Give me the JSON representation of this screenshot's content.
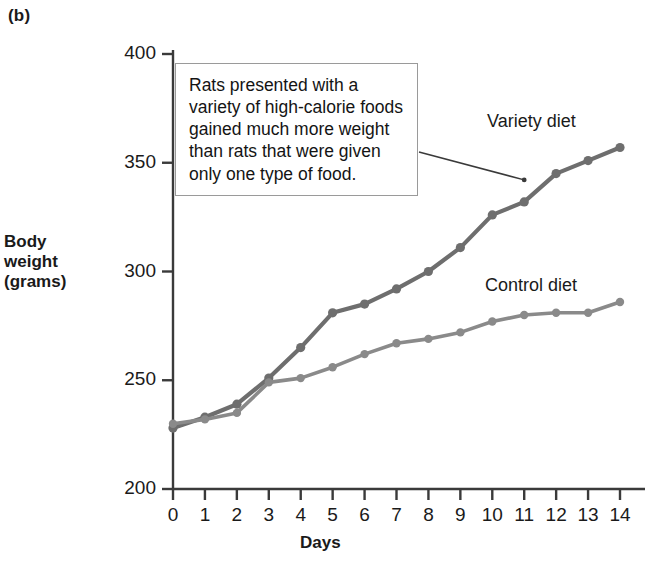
{
  "figure": {
    "panel_label": "(b)",
    "callout_text": "Rats presented with a variety of high-calorie foods gained much more weight than rats that were given only one type of food.",
    "series_label_variety": "Variety diet",
    "series_label_control": "Control diet",
    "y_axis_label_line1": "Body",
    "y_axis_label_line2": "weight",
    "y_axis_label_line3": "(grams)",
    "x_axis_label": "Days"
  },
  "colors": {
    "variety_line": "#6e6e6e",
    "control_line": "#8a8a8a",
    "axis": "#3a3a3a",
    "callout_border": "#9a9a9a",
    "text": "#1a1a1a"
  },
  "chart_data": {
    "type": "line",
    "title": "",
    "xlabel": "Days",
    "ylabel": "Body weight (grams)",
    "xlim": [
      0,
      14
    ],
    "ylim": [
      200,
      400
    ],
    "xticks": [
      0,
      1,
      2,
      3,
      4,
      5,
      6,
      7,
      8,
      9,
      10,
      11,
      12,
      13,
      14
    ],
    "yticks": [
      200,
      250,
      300,
      350,
      400
    ],
    "grid": false,
    "legend_position": "inline-right",
    "x": [
      0,
      1,
      2,
      3,
      4,
      5,
      6,
      7,
      8,
      9,
      10,
      11,
      12,
      13,
      14
    ],
    "series": [
      {
        "name": "Variety diet",
        "values": [
          228,
          233,
          239,
          251,
          265,
          281,
          285,
          292,
          300,
          311,
          326,
          332,
          345,
          351,
          357
        ]
      },
      {
        "name": "Control diet",
        "values": [
          230,
          232,
          235,
          249,
          251,
          256,
          262,
          267,
          269,
          272,
          277,
          280,
          281,
          281,
          286
        ]
      }
    ],
    "annotations": [
      {
        "text": "Rats presented with a variety of high-calorie foods gained much more weight than rats that were given only one type of food.",
        "points_to_series": "Variety diet",
        "points_to_x": 11
      }
    ],
    "tick_labels_x": [
      "0",
      "1",
      "2",
      "3",
      "4",
      "5",
      "6",
      "7",
      "8",
      "9",
      "10",
      "11",
      "12",
      "13",
      "14"
    ],
    "tick_labels_y": [
      "200",
      "250",
      "300",
      "350",
      "400"
    ]
  }
}
